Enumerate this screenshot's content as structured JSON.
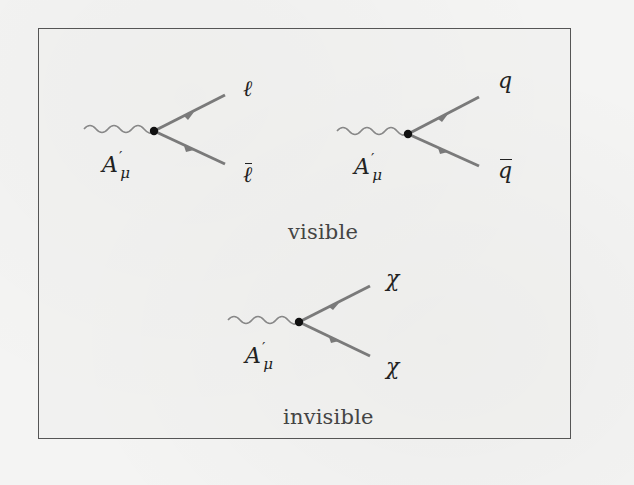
{
  "figure": {
    "frame_color": "#555555",
    "line_color": "#7a7a7a",
    "vertex_color": "#111111",
    "diagrams": [
      {
        "id": "visible-leptons",
        "incoming": {
          "symbol": "A",
          "prime": "′",
          "subscript": "μ"
        },
        "outgoing": [
          {
            "symbol": "ℓ",
            "bar": false
          },
          {
            "symbol": "ℓ",
            "bar": true
          }
        ]
      },
      {
        "id": "visible-quarks",
        "incoming": {
          "symbol": "A",
          "prime": "′",
          "subscript": "μ"
        },
        "outgoing": [
          {
            "symbol": "q",
            "bar": false
          },
          {
            "symbol": "q",
            "bar": true
          }
        ]
      },
      {
        "id": "invisible-chi",
        "incoming": {
          "symbol": "A",
          "prime": "′",
          "subscript": "μ"
        },
        "outgoing": [
          {
            "symbol": "χ",
            "bar": false
          },
          {
            "symbol": "χ",
            "bar": false
          }
        ]
      }
    ],
    "captions": {
      "visible": "visible",
      "invisible": "invisible"
    }
  }
}
